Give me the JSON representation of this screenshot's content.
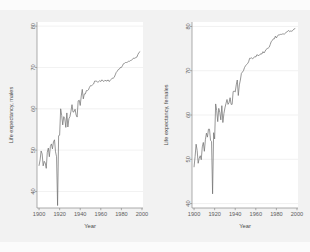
{
  "page": {
    "background_color": "#f2f2f2",
    "panel_background_color": "#ffffff",
    "line_color": "#6e6e6e",
    "grid_color": "#e3e3e3",
    "axis_color": "#8a8a8a"
  },
  "chart_data": [
    {
      "type": "line",
      "title": "",
      "xlabel": "Year",
      "ylabel": "Life expectancy, males",
      "xlim": [
        1898,
        2001
      ],
      "ylim": [
        36,
        81
      ],
      "xticks": [
        1900,
        1920,
        1940,
        1960,
        1980,
        2000
      ],
      "yticks": [
        40,
        50,
        60,
        70,
        80
      ],
      "xtick_labels": [
        "1900",
        "1920",
        "1940",
        "1960",
        "1980",
        "2000"
      ],
      "ytick_labels": [
        "40",
        "50",
        "60",
        "70",
        "80"
      ],
      "grid": true,
      "legend": "none",
      "series": [
        {
          "name": "Life expectancy, males",
          "x": [
            1900,
            1901,
            1902,
            1903,
            1904,
            1905,
            1906,
            1907,
            1908,
            1909,
            1910,
            1911,
            1912,
            1913,
            1914,
            1915,
            1916,
            1917,
            1918,
            1919,
            1920,
            1921,
            1922,
            1923,
            1924,
            1925,
            1926,
            1927,
            1928,
            1929,
            1930,
            1931,
            1932,
            1933,
            1934,
            1935,
            1936,
            1937,
            1938,
            1939,
            1940,
            1941,
            1942,
            1943,
            1944,
            1945,
            1946,
            1947,
            1948,
            1949,
            1950,
            1951,
            1952,
            1953,
            1954,
            1955,
            1956,
            1957,
            1958,
            1959,
            1960,
            1961,
            1962,
            1963,
            1964,
            1965,
            1966,
            1967,
            1968,
            1969,
            1970,
            1971,
            1972,
            1973,
            1974,
            1975,
            1976,
            1977,
            1978,
            1979,
            1980,
            1981,
            1982,
            1983,
            1984,
            1985,
            1986,
            1987,
            1988,
            1989,
            1990,
            1991,
            1992,
            1993,
            1994,
            1995,
            1996,
            1997,
            1998
          ],
          "y": [
            46.3,
            47.6,
            49.8,
            49.1,
            46.2,
            47.3,
            46.9,
            45.6,
            49.5,
            50.5,
            48.4,
            50.9,
            51.5,
            50.3,
            52.0,
            52.5,
            49.6,
            48.4,
            36.6,
            53.5,
            53.6,
            60.0,
            58.4,
            56.1,
            58.1,
            57.6,
            55.5,
            59.0,
            55.6,
            57.6,
            58.1,
            59.4,
            61.0,
            59.2,
            59.3,
            59.9,
            58.5,
            58.0,
            61.9,
            62.1,
            60.8,
            63.1,
            64.7,
            62.4,
            63.6,
            63.6,
            64.4,
            64.4,
            64.6,
            65.2,
            65.6,
            65.6,
            65.8,
            66.0,
            66.7,
            66.7,
            66.7,
            66.4,
            66.6,
            66.8,
            66.6,
            67.0,
            66.8,
            66.6,
            66.9,
            66.8,
            66.7,
            67.0,
            66.6,
            66.8,
            67.1,
            67.4,
            67.4,
            67.6,
            68.2,
            68.8,
            69.1,
            69.5,
            69.6,
            70.0,
            70.0,
            70.4,
            70.9,
            71.0,
            71.2,
            71.2,
            71.3,
            71.5,
            71.5,
            71.7,
            71.8,
            72.0,
            72.3,
            72.2,
            72.4,
            72.5,
            73.1,
            73.6,
            73.8
          ]
        }
      ]
    },
    {
      "type": "line",
      "title": "",
      "xlabel": "Year",
      "ylabel": "Life expectancy, females",
      "xlim": [
        1898,
        2001
      ],
      "ylim": [
        39,
        81
      ],
      "xticks": [
        1900,
        1920,
        1940,
        1960,
        1980,
        2000
      ],
      "yticks": [
        40,
        50,
        60,
        70,
        80
      ],
      "xtick_labels": [
        "1900",
        "1920",
        "1940",
        "1960",
        "1980",
        "2000"
      ],
      "ytick_labels": [
        "40",
        "50",
        "60",
        "70",
        "80"
      ],
      "grid": true,
      "legend": "none",
      "series": [
        {
          "name": "Life expectancy, females",
          "x": [
            1900,
            1901,
            1902,
            1903,
            1904,
            1905,
            1906,
            1907,
            1908,
            1909,
            1910,
            1911,
            1912,
            1913,
            1914,
            1915,
            1916,
            1917,
            1918,
            1919,
            1920,
            1921,
            1922,
            1923,
            1924,
            1925,
            1926,
            1927,
            1928,
            1929,
            1930,
            1931,
            1932,
            1933,
            1934,
            1935,
            1936,
            1937,
            1938,
            1939,
            1940,
            1941,
            1942,
            1943,
            1944,
            1945,
            1946,
            1947,
            1948,
            1949,
            1950,
            1951,
            1952,
            1953,
            1954,
            1955,
            1956,
            1957,
            1958,
            1959,
            1960,
            1961,
            1962,
            1963,
            1964,
            1965,
            1966,
            1967,
            1968,
            1969,
            1970,
            1971,
            1972,
            1973,
            1974,
            1975,
            1976,
            1977,
            1978,
            1979,
            1980,
            1981,
            1982,
            1983,
            1984,
            1985,
            1986,
            1987,
            1988,
            1989,
            1990,
            1991,
            1992,
            1993,
            1994,
            1995,
            1996,
            1997,
            1998
          ],
          "y": [
            48.3,
            50.6,
            53.4,
            52.0,
            49.1,
            50.2,
            50.8,
            49.9,
            52.8,
            53.8,
            51.8,
            54.4,
            55.9,
            55.0,
            56.8,
            56.8,
            54.3,
            54.0,
            42.2,
            56.0,
            54.6,
            62.5,
            61.0,
            58.5,
            61.5,
            60.6,
            58.9,
            62.1,
            58.3,
            60.3,
            61.6,
            62.6,
            63.5,
            62.4,
            62.8,
            63.9,
            62.4,
            62.4,
            65.3,
            65.4,
            65.2,
            66.8,
            67.9,
            64.4,
            66.8,
            67.9,
            69.4,
            69.7,
            70.0,
            70.7,
            71.1,
            71.4,
            71.6,
            72.0,
            72.8,
            72.8,
            72.9,
            72.7,
            72.9,
            73.2,
            73.1,
            73.6,
            73.5,
            73.4,
            73.7,
            73.8,
            73.8,
            74.3,
            74.0,
            74.4,
            74.8,
            75.0,
            75.1,
            75.3,
            75.9,
            76.6,
            76.8,
            77.2,
            77.2,
            77.8,
            77.4,
            77.8,
            78.1,
            78.1,
            78.2,
            78.2,
            78.3,
            78.3,
            78.3,
            78.5,
            78.8,
            78.9,
            79.1,
            78.8,
            79.0,
            78.9,
            79.1,
            79.4,
            79.5
          ]
        }
      ]
    }
  ]
}
